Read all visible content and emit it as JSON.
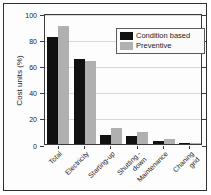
{
  "figure": {
    "ylabel": "Cost units (%)"
  },
  "colors": {
    "condition_based": "#111111",
    "preventive": "#b0b0b0",
    "gridline": "#d8d8d8",
    "axis": "#3a3a3a"
  },
  "legend": {
    "entries": [
      {
        "label": "Condition based",
        "color": "#111111"
      },
      {
        "label": "Preventive",
        "color": "#b0b0b0"
      }
    ]
  },
  "chart_data": {
    "type": "bar",
    "title": "",
    "xlabel": "",
    "ylabel": "Cost units (%)",
    "categories": [
      "Total",
      "Electricity",
      "Starting-up",
      "Shutting down",
      "Maintenance",
      "Chaning grid"
    ],
    "category_display": [
      "Total",
      "Electricity",
      "Starting-up",
      "Shutting -\ndown",
      "Maintenance",
      "Chaning\ngrid"
    ],
    "series": [
      {
        "name": "Condition based",
        "color": "#111111",
        "values": [
          82,
          65,
          7,
          6,
          2.5,
          0.5
        ]
      },
      {
        "name": "Preventive",
        "color": "#b0b0b0",
        "values": [
          90,
          63,
          12,
          9,
          3.5,
          0.7
        ]
      }
    ],
    "yticks": [
      0,
      20,
      40,
      60,
      80,
      100
    ],
    "ylim": [
      0,
      100
    ],
    "grid": true,
    "legend_position": "top-right"
  }
}
